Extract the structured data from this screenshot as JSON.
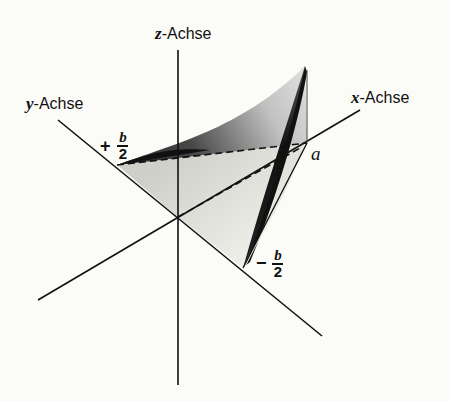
{
  "diagram": {
    "axes": {
      "z": {
        "label_var": "z",
        "label_text": "-Achse"
      },
      "y": {
        "label_var": "y",
        "label_text": "-Achse"
      },
      "x": {
        "label_var": "x",
        "label_text": "-Achse"
      }
    },
    "points": {
      "plus_half_b": {
        "sign": "+",
        "numerator": "b",
        "denominator": "2"
      },
      "minus_half_b": {
        "sign": "−",
        "numerator": "b",
        "denominator": "2"
      },
      "a": "a"
    },
    "colors": {
      "line": "#111111",
      "background": "#fbfbf8",
      "shade_light": "#d8d8d4",
      "shade_dark": "#1a1a1a"
    }
  }
}
